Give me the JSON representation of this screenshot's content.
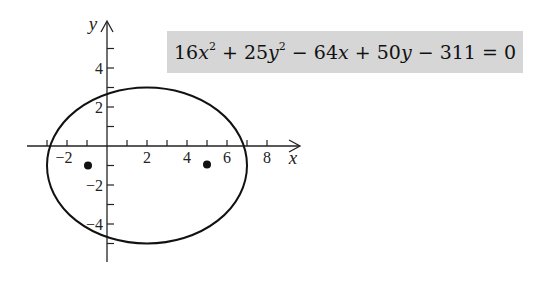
{
  "equation": {
    "text": "16x^2 + 25y^2 - 64x + 50y - 311 = 0",
    "parts": {
      "c1": "16",
      "v1": "x",
      "e1": "2",
      "op1": " + ",
      "c2": "25",
      "v2": "y",
      "e2": "2",
      "op2": " − ",
      "c3": "64",
      "v3": "x",
      "op3": " + ",
      "c4": "50",
      "v4": "y",
      "op4": " − ",
      "c5": "311",
      "eq": " = ",
      "rhs": "0"
    },
    "background": "#d6d6d6"
  },
  "axes": {
    "x_label": "x",
    "y_label": "y",
    "x_tick_labels": [
      "−2",
      "2",
      "4",
      "6",
      "8"
    ],
    "y_tick_labels": [
      "4",
      "2",
      "−2",
      "−4"
    ]
  },
  "ellipse": {
    "center": [
      2,
      -1
    ],
    "semi_major": 5,
    "semi_minor": 4,
    "x_range": [
      -3,
      7
    ],
    "y_range": [
      -5,
      3
    ]
  },
  "foci": [
    {
      "x": -1,
      "y": -1
    },
    {
      "x": 5,
      "y": -1
    }
  ]
}
